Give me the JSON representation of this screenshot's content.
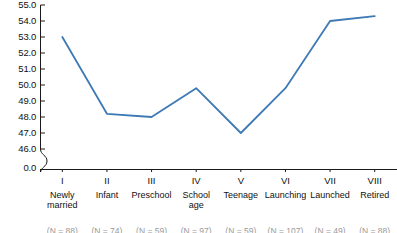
{
  "chart_data": {
    "type": "line",
    "title": "",
    "subtitle": "",
    "xlabel": "",
    "ylabel": "",
    "categories": [
      "Newly married",
      "Infant",
      "Preschool",
      "School age",
      "Teenage",
      "Launching",
      "Launched",
      "Retired"
    ],
    "stage_numerals": [
      "I",
      "II",
      "III",
      "IV",
      "V",
      "VI",
      "VII",
      "VIII"
    ],
    "category_lines": [
      [
        "Newly",
        "married"
      ],
      [
        "Infant"
      ],
      [
        "Preschool"
      ],
      [
        "School",
        "age"
      ],
      [
        "Teenage"
      ],
      [
        "Launching"
      ],
      [
        "Launched"
      ],
      [
        "Retired"
      ]
    ],
    "values": [
      53.0,
      48.2,
      48.0,
      49.8,
      47.0,
      49.8,
      54.0,
      54.3
    ],
    "sample_sizes": [
      "(N = 88)",
      "(N = 74)",
      "(N = 59)",
      "(N = 97)",
      "(N = 59)",
      "(N = 107)",
      "(N = 49)",
      "(N = 88)"
    ],
    "ylim": [
      46.0,
      55.0
    ],
    "ytick_labels": [
      "55.0",
      "54.0",
      "53.0",
      "52.0",
      "51.0",
      "50.0",
      "49.0",
      "48.0",
      "47.0",
      "46.0"
    ],
    "ytick_values": [
      55.0,
      54.0,
      53.0,
      52.0,
      51.0,
      50.0,
      49.0,
      48.0,
      47.0,
      46.0
    ],
    "axis_break": true,
    "origin_label": "0.0",
    "grid": false,
    "legend": "none",
    "line_color": "#3d7ab5",
    "axis_color": "#1a1a1a",
    "markers": false
  }
}
